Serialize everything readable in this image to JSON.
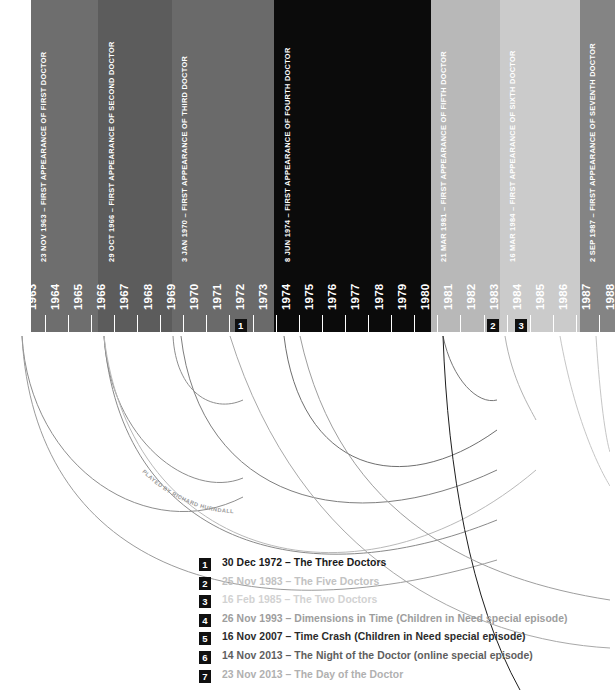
{
  "chart_data": {
    "type": "timeline",
    "xlabel": "",
    "ylabel": "",
    "x_axis": {
      "tick_labels": [
        "1963",
        "1964",
        "1965",
        "1966",
        "1967",
        "1968",
        "1969",
        "1970",
        "1971",
        "1972",
        "1973",
        "1974",
        "1975",
        "1976",
        "1977",
        "1978",
        "1979",
        "1980",
        "1981",
        "1982",
        "1983",
        "1984",
        "1985",
        "1986",
        "1987",
        "1988"
      ],
      "first_year": 1963,
      "last_year": 1988,
      "year_width_px": 23.1,
      "origin_x_px": 10,
      "baseline_y_px": 332,
      "grid": false
    },
    "eras": [
      {
        "name": "first-doctor",
        "label": "23 NOV 1963 – FIRST APPEARANCE OF FIRST DOCTOR",
        "start_year": 1963.9,
        "end_year": 1966.83,
        "color": "#6e6e6e",
        "text_color": "#ffffff"
      },
      {
        "name": "second-doctor",
        "label": "29 OCT 1966 – FIRST APPEARANCE OF SECOND DOCTOR",
        "start_year": 1966.83,
        "end_year": 1970.01,
        "color": "#5c5c5c",
        "text_color": "#ffffff"
      },
      {
        "name": "third-doctor",
        "label": "3 JAN 1970 – FIRST APPEARANCE OF THIRD DOCTOR",
        "start_year": 1970.01,
        "end_year": 1974.44,
        "color": "#6a6a6a",
        "text_color": "#ffffff"
      },
      {
        "name": "fourth-doctor",
        "label": "8 JUN 1974 – FIRST APPEARANCE OF FOURTH DOCTOR",
        "start_year": 1974.44,
        "end_year": 1981.22,
        "color": "#0b0b0b",
        "text_color": "#ffffff"
      },
      {
        "name": "fifth-doctor",
        "label": "21 MAR 1981 – FIRST APPEARANCE OF FIFTH DOCTOR",
        "start_year": 1981.22,
        "end_year": 1984.2,
        "color": "#b8b8b8",
        "text_color": "#ffffff"
      },
      {
        "name": "sixth-doctor",
        "label": "16 MAR 1984 – FIRST APPEARANCE OF SIXTH DOCTOR",
        "start_year": 1984.2,
        "end_year": 1987.67,
        "color": "#cbcbcb",
        "text_color": "#ffffff"
      },
      {
        "name": "seventh-doctor",
        "label": "2 SEP 1987 – FIRST APPEARANCE OF SEVENTH DOCTOR",
        "start_year": 1987.67,
        "end_year": 1989.2,
        "color": "#848484",
        "text_color": "#ffffff"
      }
    ],
    "axis_markers": [
      {
        "number": "1",
        "year": 1972.99
      },
      {
        "number": "2",
        "year": 1983.9
      },
      {
        "number": "3",
        "year": 1985.13
      }
    ],
    "annotations": [
      {
        "name": "hurndall-note",
        "text": "PLAYED BY RICHARD HURNDALL",
        "color": "#9a9a9a"
      }
    ]
  },
  "legend": {
    "items": [
      {
        "number": "1",
        "text": "30 Dec 1972 – The Three Doctors",
        "color": "#1a1a1a"
      },
      {
        "number": "2",
        "text": "25 Nov 1983 – The Five Doctors",
        "color": "#c2c2c2"
      },
      {
        "number": "3",
        "text": "16 Feb 1985 – The Two Doctors",
        "color": "#d2d2d2"
      },
      {
        "number": "4",
        "text": "26 Nov 1993 – Dimensions in Time (Children in Need special episode)",
        "color": "#9d9d9d"
      },
      {
        "number": "5",
        "text": "16 Nov 2007 – Time Crash (Children in Need special episode)",
        "color": "#2b2b2b"
      },
      {
        "number": "6",
        "text": "14 Nov 2013 – The Night of the Doctor (online special episode)",
        "color": "#5e5e5e"
      },
      {
        "number": "7",
        "text": "23 Nov 2013 – The Day of the Doctor",
        "color": "#b0b0b0"
      }
    ]
  }
}
